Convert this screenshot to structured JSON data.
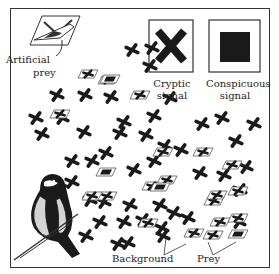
{
  "labels": {
    "artificial_prey_line1": "Artificial",
    "artificial_prey_line2": "prey",
    "cryptic_line1": "Cryptic",
    "cryptic_line2": "signal",
    "conspicuous_line1": "Conspicuous",
    "conspicuous_line2": "signal",
    "background": "Background",
    "prey": "Prey"
  },
  "colors": {
    "ink": "#1a1a1a",
    "frame": "#333333",
    "bird_belly": "#d4d4d4"
  },
  "crosses": [
    [
      132,
      50
    ],
    [
      152,
      48
    ],
    [
      150,
      66
    ],
    [
      57,
      95
    ],
    [
      85,
      95
    ],
    [
      111,
      97
    ],
    [
      170,
      98
    ],
    [
      154,
      116
    ],
    [
      36,
      118
    ],
    [
      62,
      118
    ],
    [
      124,
      122
    ],
    [
      202,
      124
    ],
    [
      222,
      118
    ],
    [
      254,
      124
    ],
    [
      42,
      134
    ],
    [
      84,
      132
    ],
    [
      120,
      133
    ],
    [
      146,
      135
    ],
    [
      236,
      141
    ],
    [
      165,
      146
    ],
    [
      106,
      153
    ],
    [
      181,
      150
    ],
    [
      72,
      161
    ],
    [
      92,
      161
    ],
    [
      154,
      161
    ],
    [
      246,
      167
    ],
    [
      134,
      170
    ],
    [
      200,
      173
    ],
    [
      224,
      175
    ],
    [
      72,
      182
    ],
    [
      240,
      190
    ],
    [
      90,
      200
    ],
    [
      104,
      202
    ],
    [
      130,
      205
    ],
    [
      160,
      205
    ],
    [
      174,
      213
    ],
    [
      124,
      222
    ],
    [
      143,
      220
    ],
    [
      188,
      218
    ],
    [
      239,
      222
    ],
    [
      100,
      222
    ],
    [
      162,
      228
    ],
    [
      86,
      236
    ],
    [
      128,
      243
    ],
    [
      163,
      236
    ],
    [
      118,
      244
    ]
  ],
  "prey_items": [
    [
      88,
      74
    ],
    [
      108,
      80
    ],
    [
      140,
      95
    ],
    [
      60,
      114
    ],
    [
      163,
      152
    ],
    [
      203,
      152
    ],
    [
      232,
      165
    ],
    [
      152,
      186
    ],
    [
      167,
      180
    ],
    [
      107,
      196
    ],
    [
      92,
      196
    ],
    [
      214,
      201
    ],
    [
      217,
      195
    ],
    [
      148,
      223
    ],
    [
      238,
      191
    ],
    [
      220,
      222
    ],
    [
      238,
      218
    ],
    [
      194,
      233
    ],
    [
      213,
      235
    ]
  ],
  "conspicuous_prey": [
    [
      110,
      79
    ],
    [
      106,
      172
    ],
    [
      160,
      187
    ],
    [
      238,
      234
    ]
  ]
}
